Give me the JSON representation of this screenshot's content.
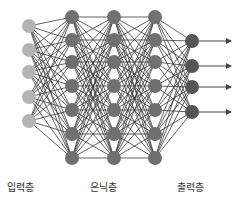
{
  "diagram": {
    "type": "neural-network",
    "colors": {
      "input_node": "#b4b4b4",
      "hidden_node": "#707070",
      "output_node": "#555555",
      "edge": "#3a3a3a",
      "arrow": "#444444",
      "label": "#333333"
    },
    "node_radius": 7,
    "layers": [
      {
        "role": "input",
        "x": 29,
        "ys": [
          26,
          50,
          72,
          97,
          121
        ]
      },
      {
        "role": "hidden",
        "x": 72,
        "ys": [
          17,
          40,
          62,
          86,
          110,
          134,
          158
        ]
      },
      {
        "role": "hidden",
        "x": 114,
        "ys": [
          17,
          40,
          62,
          86,
          110,
          134,
          158
        ]
      },
      {
        "role": "hidden",
        "x": 155,
        "ys": [
          17,
          40,
          62,
          86,
          110,
          134,
          158
        ]
      },
      {
        "role": "output",
        "x": 192,
        "ys": [
          41,
          66,
          87,
          112
        ]
      }
    ],
    "output_arrow_end_x": 231,
    "labels": {
      "input": "입력층",
      "hidden": "은닉층",
      "output": "출력층"
    }
  }
}
